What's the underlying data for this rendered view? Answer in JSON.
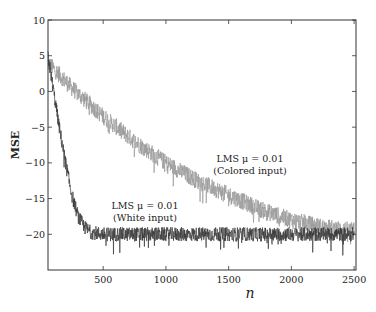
{
  "chart_data": {
    "type": "line",
    "title": "",
    "xlabel": "n",
    "ylabel": "MSE",
    "xlim": [
      60,
      2515
    ],
    "ylim": [
      -25,
      10
    ],
    "xticks": [
      500,
      1000,
      1500,
      2000,
      2500
    ],
    "xtick_labels": [
      "500",
      "1000",
      "1500",
      "2000",
      "2500"
    ],
    "yticks": [
      10,
      5,
      0,
      -5,
      -10,
      -15,
      -20
    ],
    "ytick_labels": [
      "10",
      "5",
      "0",
      "−5",
      "−10",
      "−15",
      "−20"
    ],
    "grid": false,
    "legend": "none (inline annotations)",
    "series": [
      {
        "name": "LMS μ = 0.01 (Colored input)",
        "color": "#9a9a9a",
        "x": [
          60,
          250,
          500,
          750,
          1000,
          1250,
          1500,
          1750,
          2000,
          2250,
          2500
        ],
        "values": [
          4.0,
          0.5,
          -3.5,
          -7.0,
          -10.0,
          -12.5,
          -14.5,
          -16.5,
          -18.0,
          -19.0,
          -19.5
        ],
        "noise_amplitude_db": 1.2
      },
      {
        "name": "LMS μ = 0.01 (White input)",
        "color": "#3a3a3a",
        "x": [
          60,
          100,
          150,
          200,
          250,
          300,
          350,
          400,
          500,
          1000,
          1500,
          2000,
          2500
        ],
        "values": [
          5.0,
          0.5,
          -5.0,
          -10.0,
          -14.5,
          -17.5,
          -19.0,
          -19.7,
          -20.0,
          -20.0,
          -20.0,
          -20.0,
          -20.0
        ],
        "noise_amplitude_db": 1.0
      }
    ],
    "annotations": [
      {
        "lines": [
          "LMS μ = 0.01",
          "(Colored input)"
        ],
        "x": 1750,
        "y": -10.5
      },
      {
        "lines": [
          "LMS μ = 0.01",
          "(White input)"
        ],
        "x": 760,
        "y": -17.0
      }
    ]
  },
  "labels": {
    "xlabel": "n",
    "ylabel": "MSE",
    "annot_colored_1": "LMS μ = 0.01",
    "annot_colored_2": "(Colored input)",
    "annot_white_1": "LMS μ = 0.01",
    "annot_white_2": "(White input)"
  }
}
